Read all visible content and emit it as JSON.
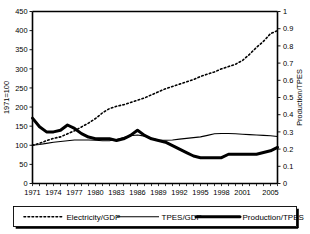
{
  "chart_data": {
    "type": "line",
    "title": "",
    "xlabel": "",
    "ylabel": "1971=100",
    "y2label": "Production/TPES",
    "grid": false,
    "legend_position": "bottom",
    "xlim": [
      1971,
      2006
    ],
    "ylim": [
      0,
      450
    ],
    "y2lim": [
      0,
      1
    ],
    "yticks": [
      0,
      50,
      100,
      150,
      200,
      250,
      300,
      350,
      400,
      450
    ],
    "ytick_labels": [
      "0",
      "50",
      "100",
      "150",
      "200",
      "250",
      "300",
      "350",
      "400",
      "450"
    ],
    "y2ticks": [
      0,
      0.1,
      0.2,
      0.3,
      0.4,
      0.5,
      0.6,
      0.7,
      0.8,
      0.9,
      1
    ],
    "y2tick_labels": [
      "0",
      "0.1",
      "0.2",
      "0.3",
      "0.4",
      "0.5",
      "0.6",
      "0.7",
      "0.8",
      "0.9",
      "1"
    ],
    "xtick_labels": [
      "1971",
      "1974",
      "1977",
      "1980",
      "1983",
      "1986",
      "1989",
      "1992",
      "1995",
      "1998",
      "2001",
      "2005"
    ],
    "xticks": [
      1971,
      1974,
      1977,
      1980,
      1983,
      1986,
      1989,
      1992,
      1995,
      1998,
      2001,
      2005
    ],
    "x": [
      1971,
      1972,
      1973,
      1974,
      1975,
      1976,
      1977,
      1978,
      1979,
      1980,
      1981,
      1982,
      1983,
      1984,
      1985,
      1986,
      1987,
      1988,
      1989,
      1990,
      1991,
      1992,
      1993,
      1994,
      1995,
      1996,
      1997,
      1998,
      1999,
      2000,
      2001,
      2002,
      2003,
      2004,
      2005,
      2006
    ],
    "series": [
      {
        "name": "Electricity/GDP",
        "axis": "left",
        "style": "dotted",
        "color": "#000000",
        "values": [
          100,
          105,
          112,
          118,
          122,
          130,
          138,
          148,
          158,
          170,
          185,
          196,
          202,
          206,
          212,
          218,
          224,
          232,
          240,
          248,
          254,
          260,
          266,
          272,
          280,
          286,
          292,
          300,
          306,
          312,
          322,
          338,
          356,
          372,
          392,
          400
        ]
      },
      {
        "name": "TPES/GDP",
        "axis": "left",
        "style": "thin-solid",
        "color": "#000000",
        "values": [
          100,
          102,
          105,
          108,
          110,
          112,
          114,
          114,
          114,
          113,
          112,
          112,
          115,
          120,
          125,
          127,
          124,
          118,
          114,
          113,
          114,
          116,
          118,
          120,
          122,
          126,
          130,
          131,
          131,
          130,
          129,
          128,
          127,
          126,
          125,
          123
        ]
      },
      {
        "name": "Production/TPES",
        "axis": "right",
        "style": "thick-solid",
        "color": "#000000",
        "values": [
          0.38,
          0.33,
          0.3,
          0.3,
          0.31,
          0.34,
          0.32,
          0.29,
          0.27,
          0.26,
          0.26,
          0.26,
          0.25,
          0.26,
          0.28,
          0.31,
          0.28,
          0.26,
          0.25,
          0.24,
          0.22,
          0.2,
          0.18,
          0.16,
          0.15,
          0.15,
          0.15,
          0.15,
          0.17,
          0.17,
          0.17,
          0.17,
          0.17,
          0.18,
          0.19,
          0.21
        ]
      }
    ],
    "legend": [
      {
        "label": "Electricity/GDP",
        "style": "dotted"
      },
      {
        "label": "TPES/GDP",
        "style": "thin-solid"
      },
      {
        "label": "Production/TPES",
        "style": "thick-solid"
      }
    ]
  }
}
